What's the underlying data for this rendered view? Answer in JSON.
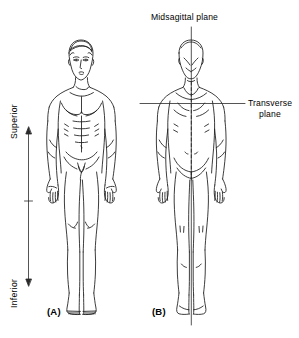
{
  "figure": {
    "title_text": "",
    "background_color": "#ffffff",
    "line_color": "#000000",
    "width": 299,
    "height": 338
  },
  "labels": {
    "midsagittal_plane": "Midsagittal plane",
    "transverse_plane": "Transverse plane",
    "superior": "Superior",
    "inferior": "Inferior",
    "panel_a": "(A)",
    "panel_b": "(B)"
  },
  "panels": [
    {
      "id": "A",
      "label": "(A)",
      "view": "anterior",
      "description": "Anterior (front) view of a standing male body in anatomical position"
    },
    {
      "id": "B",
      "label": "(B)",
      "view": "posterior",
      "description": "Posterior (back) view of a standing male body in anatomical position"
    }
  ],
  "reference_lines": [
    {
      "name": "midsagittal-plane-line",
      "orientation": "vertical",
      "label": "Midsagittal plane"
    },
    {
      "name": "transverse-plane-line",
      "orientation": "horizontal",
      "label": "Transverse plane"
    },
    {
      "name": "superior-inferior-axis",
      "orientation": "vertical",
      "arrowheads": "both",
      "top_label": "Superior",
      "bottom_label": "Inferior"
    }
  ]
}
